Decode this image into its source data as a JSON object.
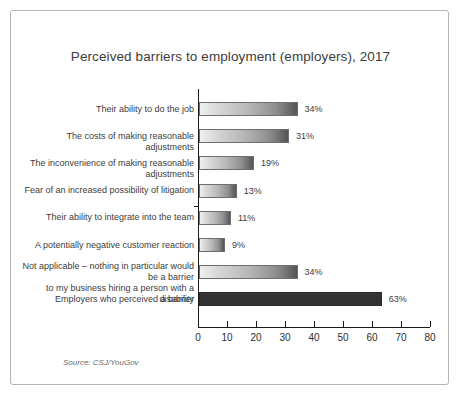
{
  "chart_data": {
    "type": "bar",
    "orientation": "horizontal",
    "title": "Perceived barriers to employment (employers), 2017",
    "xlabel": "",
    "ylabel": "",
    "xlim": [
      0,
      80
    ],
    "xticks": [
      0,
      10,
      20,
      30,
      40,
      50,
      60,
      70,
      80
    ],
    "grid": false,
    "legend": null,
    "source": "Source: CSJ/YouGov",
    "categories": [
      "Their ability to do the job",
      "The costs of making reasonable adjustments",
      "The inconvenience of making reasonable adjustments",
      "Fear of an increased possibility of litigation",
      "Their ability to integrate into the team",
      "A potentially negative customer reaction",
      "Not applicable – nothing in particular would be a barrier to my business hiring a person with a disability",
      "Employers who perceived a barrier"
    ],
    "values": [
      34,
      31,
      19,
      13,
      11,
      9,
      34,
      63
    ],
    "value_labels": [
      "34%",
      "31%",
      "19%",
      "13%",
      "11%",
      "9%",
      "34%",
      "63%"
    ],
    "bar_styles": [
      "gradient",
      "gradient",
      "gradient",
      "gradient",
      "gradient",
      "gradient",
      "gradient",
      "solid-dark"
    ],
    "colors": {
      "bar_gradient_start": "#efefef",
      "bar_gradient_end": "#555555",
      "bar_border": "#6e6e6e",
      "bar_dark": "#333333",
      "axis": "#1a1a1a",
      "text": "#3c3c3c",
      "frame_border": "#b4b4b4",
      "background": "#ffffff"
    }
  },
  "category_label_lines": [
    [
      "Their ability to do the job"
    ],
    [
      "The costs of making reasonable adjustments"
    ],
    [
      "The inconvenience of making reasonable adjustments"
    ],
    [
      "Fear of an increased possibility of litigation"
    ],
    [
      "Their ability to integrate into the team"
    ],
    [
      "A potentially negative customer reaction"
    ],
    [
      "Not applicable – nothing in particular would be a barrier",
      "to my business hiring a person with a disability"
    ],
    [
      "Employers who perceived a barrier"
    ]
  ]
}
